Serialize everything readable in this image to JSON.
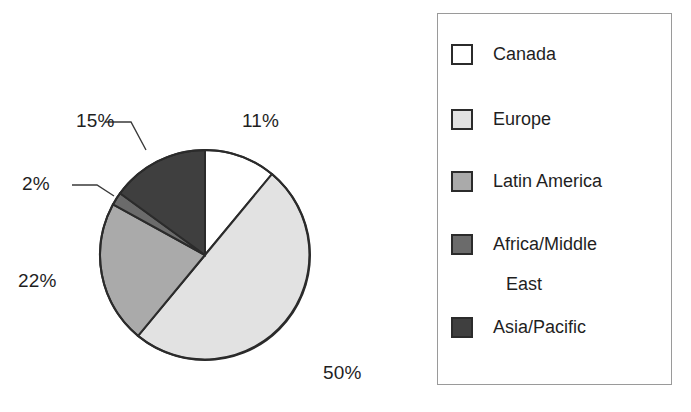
{
  "chart_data": {
    "type": "pie",
    "title": "",
    "categories": [
      "Canada",
      "Europe",
      "Latin America",
      "Africa/Middle East",
      "Asia/Pacific"
    ],
    "values": [
      11,
      50,
      22,
      2,
      15
    ],
    "value_labels": [
      "11%",
      "50%",
      "22%",
      "2%",
      "15%"
    ],
    "unit": "percent",
    "start_angle_deg": 0,
    "direction": "clockwise",
    "legend_position": "right",
    "grid": false,
    "xlabel": "",
    "ylabel": "",
    "slice_colors": [
      "#ffffff",
      "#e2e2e2",
      "#aaaaaa",
      "#6b6b6b",
      "#3f3f3f"
    ],
    "outline_color": "#2b2b2b"
  },
  "pie": {
    "labels": {
      "canada": "11%",
      "europe": "50%",
      "latin_america": "22%",
      "africa_middle_east": "2%",
      "asia_pacific": "15%"
    }
  },
  "legend": {
    "items": [
      {
        "label": "Canada",
        "label_line2": "",
        "color": "#ffffff"
      },
      {
        "label": "Europe",
        "label_line2": "",
        "color": "#e2e2e2"
      },
      {
        "label": "Latin America",
        "label_line2": "",
        "color": "#aaaaaa"
      },
      {
        "label": "Africa/Middle",
        "label_line2": "East",
        "color": "#6b6b6b"
      },
      {
        "label": "Asia/Pacific",
        "label_line2": "",
        "color": "#3f3f3f"
      }
    ]
  }
}
